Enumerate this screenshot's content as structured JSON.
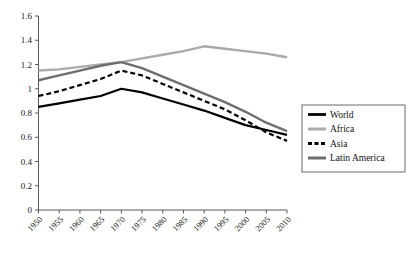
{
  "chart_data": {
    "type": "line",
    "title": "",
    "xlabel": "",
    "ylabel": "",
    "x": [
      1950,
      1955,
      1960,
      1965,
      1970,
      1975,
      1980,
      1985,
      1990,
      1995,
      2000,
      2005,
      2010
    ],
    "categories": [
      "1950",
      "1955",
      "1960",
      "1965",
      "1970",
      "1975",
      "1980",
      "1985",
      "1990",
      "1995",
      "2000",
      "2005",
      "2010"
    ],
    "ylim": [
      0,
      1.6
    ],
    "xlim": [
      1950,
      2010
    ],
    "ytick_labels": [
      "1.6",
      "1.4",
      "1.2",
      "1",
      "0.8",
      "0.6",
      "0.4",
      "0.2",
      "0"
    ],
    "ytick_values": [
      1.6,
      1.4,
      1.2,
      1.0,
      0.8,
      0.6,
      0.4,
      0.2,
      0.0
    ],
    "grid": false,
    "legend_position": "right",
    "series": [
      {
        "name": "World",
        "color": "#000000",
        "style": "solid",
        "width": 2.2,
        "values": [
          0.85,
          0.88,
          0.91,
          0.94,
          1.0,
          0.97,
          0.92,
          0.87,
          0.82,
          0.76,
          0.7,
          0.66,
          0.62
        ]
      },
      {
        "name": "Africa",
        "color": "#aaaaaa",
        "style": "solid",
        "width": 2.4,
        "values": [
          1.15,
          1.16,
          1.18,
          1.2,
          1.22,
          1.25,
          1.28,
          1.31,
          1.35,
          1.33,
          1.31,
          1.29,
          1.26
        ]
      },
      {
        "name": "Asia",
        "color": "#000000",
        "style": "dashed",
        "width": 2.2,
        "values": [
          0.94,
          0.98,
          1.03,
          1.08,
          1.15,
          1.11,
          1.04,
          0.97,
          0.9,
          0.83,
          0.74,
          0.64,
          0.57
        ]
      },
      {
        "name": "Latin America",
        "color": "#6e6e6e",
        "style": "solid",
        "width": 2.4,
        "values": [
          1.07,
          1.11,
          1.15,
          1.19,
          1.22,
          1.17,
          1.1,
          1.03,
          0.96,
          0.89,
          0.81,
          0.72,
          0.65
        ]
      }
    ]
  },
  "legend": {
    "items": [
      {
        "label": "World"
      },
      {
        "label": "Africa"
      },
      {
        "label": "Asia"
      },
      {
        "label": "Latin America"
      }
    ]
  }
}
